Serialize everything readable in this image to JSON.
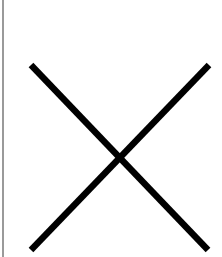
{
  "icon": {
    "name": "close-icon",
    "stroke_color": "#000000",
    "background_color": "#ffffff",
    "edge_line_color": "#9a9a9a"
  }
}
